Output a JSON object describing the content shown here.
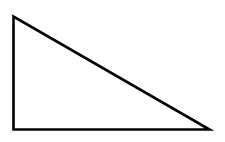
{
  "diagram": {
    "type": "right-triangle",
    "background": "#ffffff",
    "stroke_color": "#000000",
    "stroke_width": 2.6,
    "fill": "none",
    "vertices": {
      "top": [
        13.5,
        16.5
      ],
      "right_angle": [
        13.5,
        129.5
      ],
      "right": [
        209.5,
        129.5
      ]
    }
  }
}
